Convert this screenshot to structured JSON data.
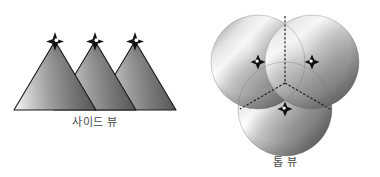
{
  "figure": {
    "width": 380,
    "height": 177,
    "background": "#ffffff"
  },
  "panels": [
    {
      "id": "side-view",
      "caption": "사이드 뷰",
      "shape": "cone",
      "count": 3,
      "marker": "four-point-star",
      "outline_color": "#1a1a1a",
      "fill_light": "#f2f2f2",
      "fill_mid": "#9a9a9a",
      "fill_dark": "#4a4a4a",
      "cones": [
        {
          "label": "cone-1",
          "apex_x": 55,
          "apex_y": 41,
          "base_y": 110,
          "base_left_x": 14,
          "base_right_x": 96
        },
        {
          "label": "cone-2",
          "apex_x": 95,
          "apex_y": 41,
          "base_y": 110,
          "base_left_x": 54,
          "base_right_x": 136
        },
        {
          "label": "cone-3",
          "apex_x": 135,
          "apex_y": 41,
          "base_y": 110,
          "base_left_x": 94,
          "base_right_x": 176
        }
      ]
    },
    {
      "id": "top-view",
      "caption": "톱 뷰",
      "shape": "circle",
      "count": 3,
      "marker": "four-point-diamond",
      "divider_style": "dashed",
      "divider_color": "#1a1a1a",
      "fill_light": "#fbfbfb",
      "fill_mid": "#a8a8a8",
      "fill_dark": "#5a5a5a",
      "circles": [
        {
          "label": "circle-top-left",
          "cx": 68,
          "cy": 62,
          "r": 47
        },
        {
          "label": "circle-top-right",
          "cx": 122,
          "cy": 62,
          "r": 47
        },
        {
          "label": "circle-bottom",
          "cx": 95,
          "cy": 109,
          "r": 47
        }
      ]
    }
  ],
  "captions": {
    "side_view": "사이드 뷰",
    "top_view": "톱 뷰"
  },
  "colors": {
    "background": "#ffffff",
    "caption_text": "#4a4a4a",
    "outline": "#1a1a1a",
    "marker_fill": "#111111",
    "highlight": "#ffffff"
  }
}
